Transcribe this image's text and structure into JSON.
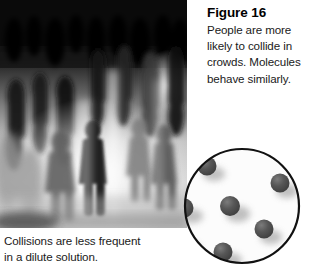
{
  "figure": {
    "title": "Figure 16",
    "caption_lines": [
      "People are more",
      "likely to collide in",
      "crowds. Molecules",
      "behave similarly."
    ],
    "bottom_caption_lines": [
      "Collisions are less frequent",
      "in a dilute solution."
    ]
  },
  "photo": {
    "alt": "Blurred black and white photograph of a crowd of people walking",
    "palette": {
      "darkest": "#0d0d0d",
      "dark": "#2b2b2b",
      "mid": "#6f6f6f",
      "light": "#c9c9c9",
      "lightest": "#f2f2f2"
    }
  },
  "diagram": {
    "name": "dilute-solution-diagram",
    "circle": {
      "outline_color": "#111111",
      "fill_color": "#fbfbfb",
      "cx": 64,
      "cy": 62,
      "r": 58,
      "stroke_width": 2.2
    },
    "molecule_color": "#4a4a4a",
    "molecule_highlight": "#6e6e6e",
    "molecule_count": 7,
    "molecules": [
      {
        "cx": 29,
        "cy": 22,
        "r": 9.5
      },
      {
        "cx": 102,
        "cy": 39,
        "r": 9.5
      },
      {
        "cx": 6,
        "cy": 64,
        "r": 9.5
      },
      {
        "cx": 52,
        "cy": 62,
        "r": 10.0
      },
      {
        "cx": 4,
        "cy": 97,
        "r": 9.5
      },
      {
        "cx": 86,
        "cy": 85,
        "r": 9.5
      },
      {
        "cx": 45,
        "cy": 108,
        "r": 9.5
      }
    ]
  }
}
